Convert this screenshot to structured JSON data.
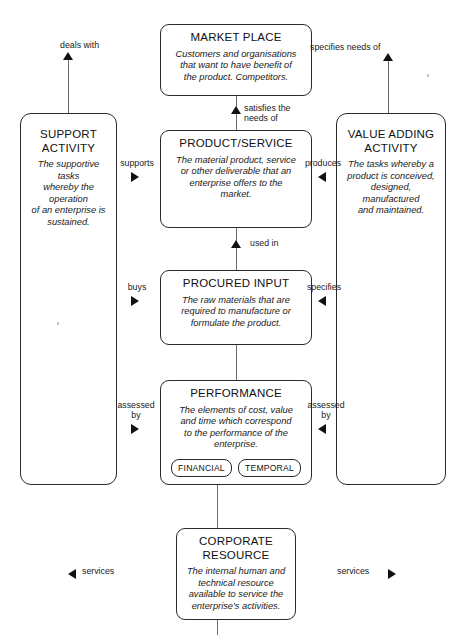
{
  "diagram": {
    "line_color": "#6f6f6f",
    "box_border_color": "#2a2a2a",
    "text_color": "#1a1a1a"
  },
  "boxes": {
    "market_place": {
      "title": "MARKET PLACE",
      "desc": "Customers and organisations\nthat want to have benefit of\nthe product. Competitors."
    },
    "support_activity": {
      "title": "SUPPORT\nACTIVITY",
      "desc": "The supportive tasks\nwhereby the operation\nof an enterprise is\nsustained."
    },
    "value_adding_activity": {
      "title": "VALUE ADDING\nACTIVITY",
      "desc": "The tasks whereby a\nproduct is conceived,\ndesigned, manufactured\nand maintained."
    },
    "product_service": {
      "title": "PRODUCT/SERVICE",
      "desc": "The material product, service\nor other deliverable that an\nenterprise offers to the\nmarket."
    },
    "procured_input": {
      "title": "PROCURED INPUT",
      "desc": "The raw materials that are\nrequired to manufacture or\nformulate the product."
    },
    "performance": {
      "title": "PERFORMANCE",
      "desc": "The elements of cost, value\nand time which correspond\nto the performance of the\nenterprise.",
      "pills": [
        {
          "label": "FINANCIAL"
        },
        {
          "label": "TEMPORAL"
        }
      ]
    },
    "corporate_resource": {
      "title": "CORPORATE\nRESOURCE",
      "desc": "The internal human and\ntechnical resource\navailable to service the\nenterprise's activities."
    }
  },
  "edges": [
    {
      "id": "deals-with",
      "label": "deals with",
      "direction": "up"
    },
    {
      "id": "specifies-needs-of",
      "label": "specifies needs of",
      "direction": "up"
    },
    {
      "id": "satisfies-the-needs-of",
      "label": "satisfies the\nneeds of",
      "direction": "up"
    },
    {
      "id": "supports",
      "label": "supports",
      "direction": "right"
    },
    {
      "id": "produces",
      "label": "produces",
      "direction": "left"
    },
    {
      "id": "used-in",
      "label": "used in",
      "direction": "up"
    },
    {
      "id": "buys",
      "label": "buys",
      "direction": "right"
    },
    {
      "id": "specifies",
      "label": "specifies",
      "direction": "left"
    },
    {
      "id": "assessed-by-left",
      "label": "assessed\nby",
      "direction": "right"
    },
    {
      "id": "assessed-by-right",
      "label": "assessed\nby",
      "direction": "left"
    },
    {
      "id": "services-left",
      "label": "services",
      "direction": "left"
    },
    {
      "id": "services-right",
      "label": "services",
      "direction": "right"
    }
  ]
}
